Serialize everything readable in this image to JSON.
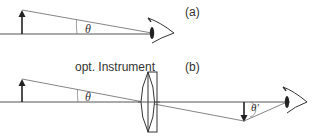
{
  "diagram": {
    "panel_a": {
      "label": "(a)",
      "angle_label": "θ",
      "description": "Object viewed directly by the eye subtends angle θ"
    },
    "panel_b": {
      "label": "(b)",
      "instrument_label": "opt. Instrument",
      "angle_label": "θ",
      "image_angle_label": "θ'",
      "description": "Object viewed through optical instrument; image subtends angle θ'"
    },
    "colors": {
      "line": "#555555",
      "arrow": "#222222",
      "background": "#ffffff"
    }
  }
}
